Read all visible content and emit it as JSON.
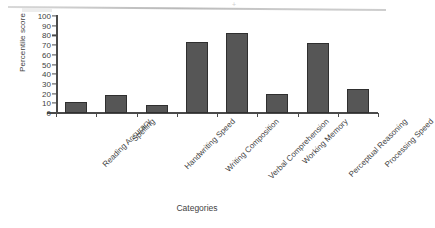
{
  "chart_data": {
    "type": "bar",
    "title": "",
    "xlabel": "Categories",
    "ylabel": "Percentile score",
    "ylim": [
      0,
      100
    ],
    "yticks": [
      0,
      10,
      20,
      30,
      40,
      50,
      60,
      70,
      80,
      90,
      100
    ],
    "grid": false,
    "legend": null,
    "bar_color": "#565656",
    "bar_edge_color": "#2f2f2f",
    "categories": [
      "Reading Accuracy",
      "Spelling",
      "Handwriting Speed",
      "Writing Composition",
      "Verbal Comprehension",
      "Working Memory",
      "Perceptual Reasoning",
      "Processing Speed"
    ],
    "values": [
      11,
      19,
      8,
      73,
      83,
      20,
      72,
      25
    ]
  }
}
